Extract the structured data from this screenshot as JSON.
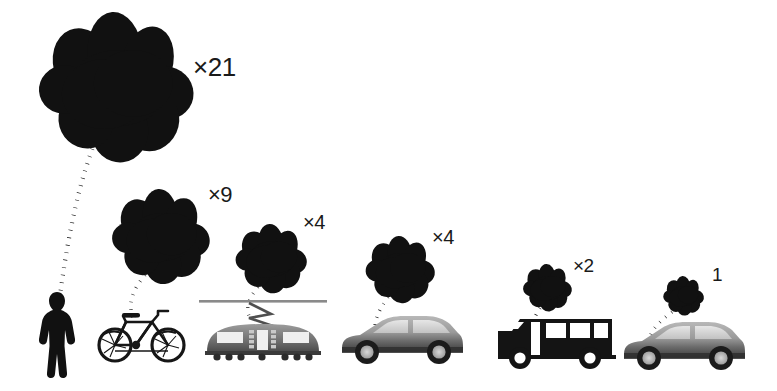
{
  "figure": {
    "background_color": "#ffffff",
    "ink_color": "#111111",
    "vehicle_gray": "#8d8d8d"
  },
  "chart_data": {
    "type": "bar",
    "xlabel": "",
    "ylabel": "Relative emissions (multiples of baseline)",
    "categories": [
      "Pedestrian",
      "Bicycle",
      "Tram",
      "Car (shared)",
      "Bus",
      "Car (single occupant)"
    ],
    "values": [
      21,
      9,
      4,
      4,
      2,
      1
    ],
    "labels": [
      "×21",
      "×9",
      "×4",
      "×4",
      "×2",
      "1"
    ],
    "units": "relative multiple",
    "grid": false,
    "legend": false,
    "note": "Cloud glyph size encodes the relative value; larger cloud = larger multiple."
  },
  "items": [
    {
      "id": "pedestrian",
      "icon": "pedestrian-icon",
      "label": "×21",
      "value": 21,
      "label_x": 193,
      "label_y": 54,
      "label_size": 26,
      "cloud_cx": 118,
      "cloud_cy": 88,
      "cloud_r": 76,
      "trail_path": "M 95 142 C 76 190 66 250 60 296",
      "vehicle_x": 40,
      "vehicle_y": 292
    },
    {
      "id": "bicycle",
      "icon": "bicycle-icon",
      "label": "×9",
      "value": 9,
      "label_x": 208,
      "label_y": 184,
      "label_size": 22,
      "cloud_cx": 162,
      "cloud_cy": 237,
      "cloud_r": 48,
      "trail_path": "M 145 275 C 131 292 128 305 133 318",
      "vehicle_x": 96,
      "vehicle_y": 305
    },
    {
      "id": "tram",
      "icon": "tram-icon",
      "label": "×4",
      "value": 4,
      "label_x": 303,
      "label_y": 212,
      "label_size": 20,
      "cloud_cx": 272,
      "cloud_cy": 259,
      "cloud_r": 35,
      "trail_path": "M 258 287 C 248 299 246 308 249 316",
      "vehicle_x": 199,
      "vehicle_y": 300
    },
    {
      "id": "car-shared",
      "icon": "car-icon",
      "label": "×4",
      "value": 4,
      "label_x": 432,
      "label_y": 227,
      "label_size": 20,
      "cloud_cx": 401,
      "cloud_cy": 270,
      "cloud_r": 34,
      "trail_path": "M 388 297 C 378 311 374 322 375 331",
      "vehicle_x": 340,
      "vehicle_y": 308
    },
    {
      "id": "bus",
      "icon": "bus-icon",
      "label": "×2",
      "value": 2,
      "label_x": 573,
      "label_y": 256,
      "label_size": 19,
      "cloud_cx": 548,
      "cloud_cy": 288,
      "cloud_r": 24,
      "trail_path": "M 540 308 C 534 317 532 324 533 331",
      "vehicle_x": 498,
      "vehicle_y": 305
    },
    {
      "id": "car-single",
      "icon": "car-icon",
      "label": "1",
      "value": 1,
      "label_x": 712,
      "label_y": 265,
      "label_size": 19,
      "cloud_cx": 684,
      "cloud_cy": 296,
      "cloud_r": 20,
      "trail_path": "M 672 312 C 660 321 652 329 650 337",
      "vehicle_x": 622,
      "vehicle_y": 314
    }
  ]
}
